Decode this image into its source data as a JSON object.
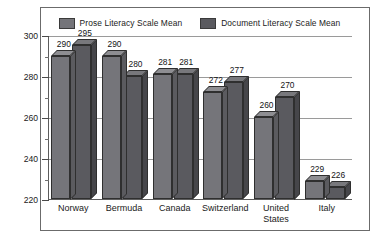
{
  "chart_data": {
    "type": "bar",
    "title": "",
    "xlabel": "",
    "ylabel": "",
    "ylim": [
      220,
      300
    ],
    "ytick_labels": [
      "300",
      "280",
      "260",
      "240",
      "220"
    ],
    "ytick_values": [
      300,
      280,
      260,
      240,
      220
    ],
    "yminor_values": [
      290,
      270,
      250,
      230
    ],
    "grid": true,
    "legend_position": "top-center",
    "categories": [
      "Norway",
      "Bermuda",
      "Canada",
      "Switzerland",
      "United States",
      "Italy"
    ],
    "series": [
      {
        "name": "Prose Literacy Scale Mean",
        "color": "#75757a",
        "values": [
          290,
          290,
          281,
          272,
          260,
          229
        ]
      },
      {
        "name": "Document Literacy Scale Mean",
        "color": "#5a5a5f",
        "values": [
          295,
          280,
          281,
          277,
          270,
          226
        ]
      }
    ]
  },
  "legend": {
    "entries": [
      {
        "label": "Prose Literacy Scale Mean",
        "swatch": "#75757a"
      },
      {
        "label": "Document Literacy Scale Mean",
        "swatch": "#5a5a5f"
      }
    ]
  },
  "colors": {
    "prose": "#75757a",
    "document": "#5a5a5f",
    "frame": "#6b6b6b",
    "gridline": "#9a9a9a",
    "axis": "#5c5c5c",
    "text": "#1a1a1a",
    "background": "#ffffff"
  }
}
